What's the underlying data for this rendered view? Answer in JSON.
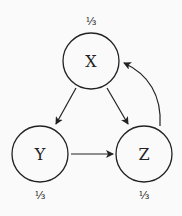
{
  "diagram": {
    "nodes": [
      {
        "id": "X",
        "label": "X",
        "prob": "⅓",
        "cx": 91,
        "cy": 61,
        "r": 28,
        "prob_x": 91,
        "prob_y": 25
      },
      {
        "id": "Y",
        "label": "Y",
        "prob": "⅓",
        "cx": 40,
        "cy": 154,
        "r": 28,
        "prob_x": 40,
        "prob_y": 199
      },
      {
        "id": "Z",
        "label": "Z",
        "prob": "⅓",
        "cx": 144,
        "cy": 154,
        "r": 28,
        "prob_x": 144,
        "prob_y": 199
      }
    ],
    "edges": [
      {
        "from": "X",
        "to": "Y"
      },
      {
        "from": "X",
        "to": "Z"
      },
      {
        "from": "Y",
        "to": "Z"
      },
      {
        "from": "Z",
        "to": "X",
        "curved": true
      }
    ],
    "colors": {
      "stroke": "#222222",
      "background": "#fafafa"
    }
  }
}
